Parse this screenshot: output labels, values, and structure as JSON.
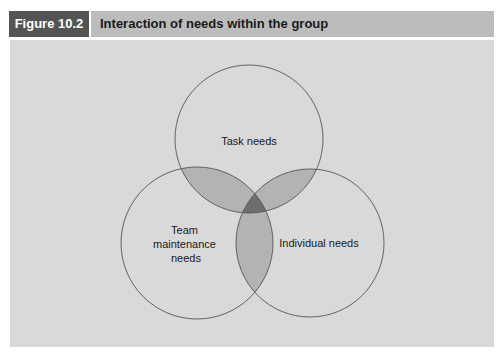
{
  "header": {
    "figure_number": "Figure 10.2",
    "title": "Interaction of needs within the group"
  },
  "diagram": {
    "type": "venn",
    "colors": {
      "background": "#d9d9d9",
      "circle_fill": "#d4d4d4",
      "pair_overlap": "#b3b3b3",
      "triple_overlap": "#6e6e6e",
      "stroke": "#555555",
      "header_label_bg": "#545454",
      "header_title_bg": "#bcbcbc"
    },
    "sets": [
      {
        "id": "task",
        "label_lines": [
          "Task needs"
        ],
        "cx": 249,
        "cy": 139,
        "r": 74
      },
      {
        "id": "team",
        "label_lines": [
          "Team",
          "maintenance",
          "needs"
        ],
        "cx": 197,
        "cy": 243,
        "r": 76
      },
      {
        "id": "individual",
        "label_lines": [
          "Individual needs"
        ],
        "cx": 310,
        "cy": 243,
        "r": 74
      }
    ]
  }
}
